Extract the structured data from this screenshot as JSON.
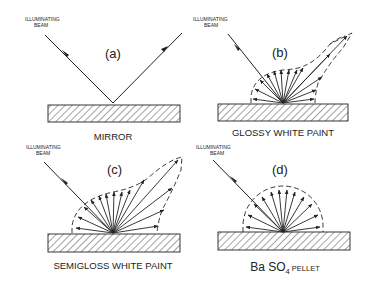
{
  "panels": [
    {
      "id": "a",
      "label": "(a)",
      "beam_label_line1": "ILLUMINATING",
      "beam_label_line2": "BEAM",
      "caption": "MIRROR"
    },
    {
      "id": "b",
      "label": "(b)",
      "beam_label_line1": "ILLUMINATING",
      "beam_label_line2": "BEAM",
      "caption": "GLOSSY WHITE PAINT"
    },
    {
      "id": "c",
      "label": "(c)",
      "beam_label_line1": "ILLUMINATING",
      "beam_label_line2": "BEAM",
      "caption": "SEMIGLOSS WHITE PAINT"
    },
    {
      "id": "d",
      "label": "(d)",
      "beam_label_line1": "ILLUMINATING",
      "beam_label_line2": "BEAM",
      "caption_main": "Ba SO",
      "caption_sub": "4",
      "caption_suffix": " PELLET"
    }
  ],
  "colors": {
    "line": "#222222",
    "background": "#ffffff"
  }
}
